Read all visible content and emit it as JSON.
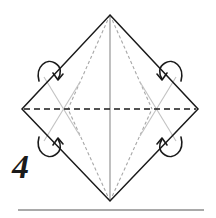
{
  "figure": {
    "kind": "origami-fold-diagram",
    "step_number": "4",
    "canvas": {
      "width": 216,
      "height": 218
    },
    "colors": {
      "background": "#ffffff",
      "outline": "#1a1a1a",
      "valley_dash": "#1a1a1a",
      "ghost_line": "#b9b9b9",
      "ghost_dash": "#a8a8a8",
      "arrow": "#1a1a1a",
      "rule": "#8c8c8c",
      "number": "#1a1a1a"
    },
    "shape": {
      "name": "kite-diamond",
      "vertices": {
        "top": {
          "x": 110,
          "y": 15
        },
        "left": {
          "x": 22,
          "y": 109
        },
        "right": {
          "x": 198,
          "y": 109
        },
        "bottom": {
          "x": 110,
          "y": 201
        }
      }
    },
    "creases": {
      "horizontal_valley": {
        "label": "horizontal-valley-crease",
        "from": {
          "x": 22,
          "y": 109
        },
        "to": {
          "x": 198,
          "y": 109
        },
        "style": "dashed",
        "color": "#1a1a1a"
      },
      "center_vertical": {
        "label": "center-vertical-line",
        "from": {
          "x": 110,
          "y": 15
        },
        "to": {
          "x": 110,
          "y": 201
        },
        "style": "solid",
        "color": "#b9b9b9"
      },
      "ghost_diagonals": [
        {
          "label": "ghost-top-left-to-mid-right",
          "from": {
            "x": 110,
            "y": 15
          },
          "to": {
            "x": 68,
            "y": 109
          }
        },
        {
          "label": "ghost-top-right-to-mid-left",
          "from": {
            "x": 110,
            "y": 15
          },
          "to": {
            "x": 152,
            "y": 109
          }
        },
        {
          "label": "ghost-bottom-left",
          "from": {
            "x": 110,
            "y": 201
          },
          "to": {
            "x": 68,
            "y": 109
          }
        },
        {
          "label": "ghost-bottom-right",
          "from": {
            "x": 110,
            "y": 201
          },
          "to": {
            "x": 152,
            "y": 109
          }
        },
        {
          "label": "ghost-left-upper",
          "from": {
            "x": 22,
            "y": 109
          },
          "to": {
            "x": 82,
            "y": 75
          }
        },
        {
          "label": "ghost-left-lower",
          "from": {
            "x": 22,
            "y": 109
          },
          "to": {
            "x": 82,
            "y": 143
          }
        },
        {
          "label": "ghost-right-upper",
          "from": {
            "x": 198,
            "y": 109
          },
          "to": {
            "x": 138,
            "y": 75
          }
        },
        {
          "label": "ghost-right-lower",
          "from": {
            "x": 198,
            "y": 109
          },
          "to": {
            "x": 138,
            "y": 143
          }
        }
      ]
    },
    "arrows": [
      {
        "label": "fold-arrow-top-left",
        "position": "top-left",
        "direction": "wrap-inward-down-right"
      },
      {
        "label": "fold-arrow-top-right",
        "position": "top-right",
        "direction": "wrap-inward-down-left"
      },
      {
        "label": "fold-arrow-bottom-left",
        "position": "bottom-left",
        "direction": "wrap-inward-up-right"
      },
      {
        "label": "fold-arrow-bottom-right",
        "position": "bottom-right",
        "direction": "wrap-inward-up-left"
      }
    ],
    "rule": {
      "label": "bottom-separator-rule",
      "from": {
        "x": 18,
        "y": 210
      },
      "to": {
        "x": 204,
        "y": 210
      },
      "color": "#8c8c8c"
    }
  }
}
